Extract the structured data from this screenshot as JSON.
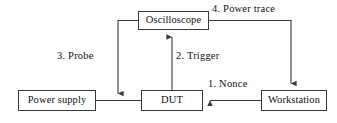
{
  "diagram": {
    "background_color": "#fdfdfd",
    "line_color": "#3a3a3a",
    "text_color": "#111111",
    "nodes": [
      {
        "id": "oscilloscope",
        "label": "Oscilloscope"
      },
      {
        "id": "power_supply",
        "label": "Power supply"
      },
      {
        "id": "dut",
        "label": "DUT"
      },
      {
        "id": "workstation",
        "label": "Workstation"
      }
    ],
    "edges": [
      {
        "id": "nonce",
        "label": "1. Nonce",
        "from": "workstation",
        "to": "dut",
        "direction": "left"
      },
      {
        "id": "trigger",
        "label": "2. Trigger",
        "from": "dut",
        "to": "oscilloscope",
        "direction": "up"
      },
      {
        "id": "probe",
        "label": "3. Probe",
        "from": "oscilloscope",
        "to": "power_line",
        "direction": "down"
      },
      {
        "id": "power_trace",
        "label": "4. Power trace",
        "from": "oscilloscope",
        "to": "workstation",
        "direction": "down"
      },
      {
        "id": "supply_link",
        "label": "",
        "from": "power_supply",
        "to": "dut",
        "direction": "none"
      }
    ]
  }
}
